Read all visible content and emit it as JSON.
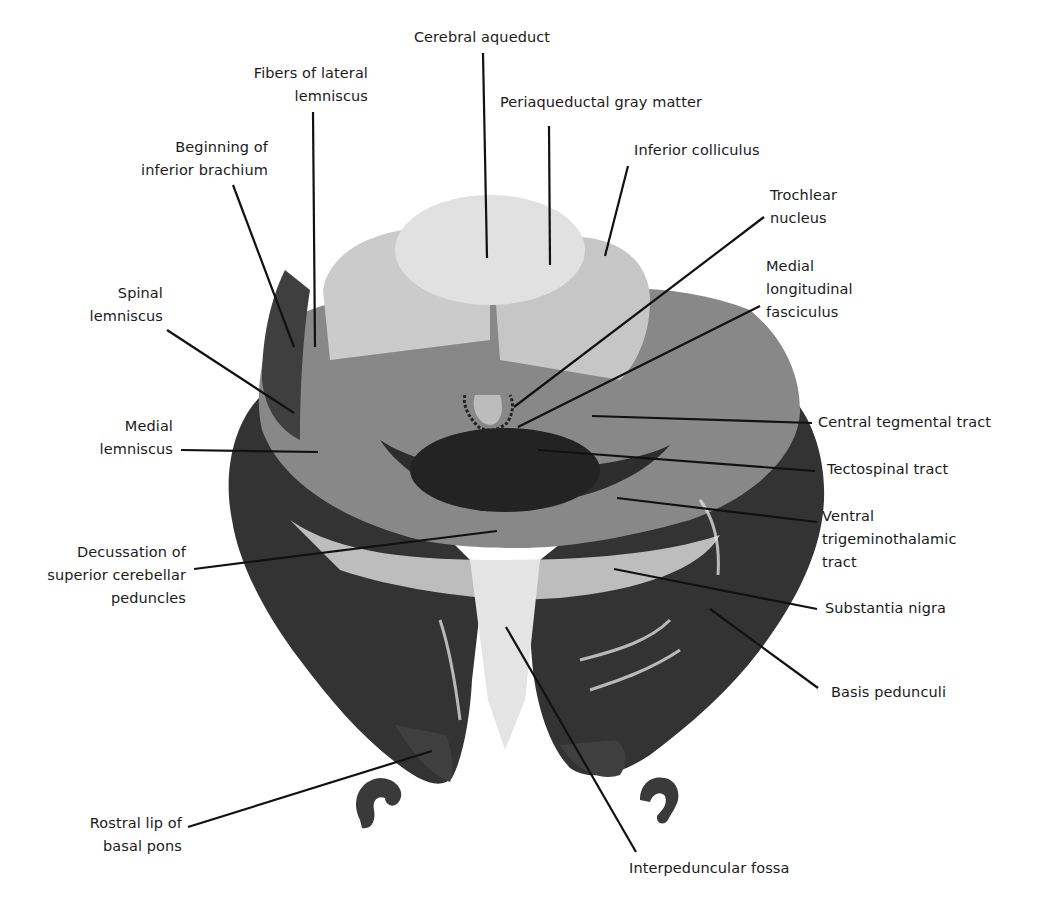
{
  "figure": {
    "colors": {
      "background": "#ffffff",
      "label_text": "#1a1a1a",
      "leader_line": "#111111",
      "tissue_light": "#cfcfcf",
      "tissue_mid": "#8a8a8a",
      "tissue_dark": "#2e2e2e"
    }
  },
  "labels": {
    "cerebral_aqueduct": "Cerebral aqueduct",
    "fibers_lateral_lemniscus": "Fibers of lateral\nlemniscus",
    "periaqueductal_gray": "Periaqueductal gray matter",
    "beginning_inferior_brachium": "Beginning of\ninferior brachium",
    "inferior_colliculus": "Inferior colliculus",
    "trochlear_nucleus": "Trochlear\nnucleus",
    "spinal_lemniscus": "Spinal\nlemniscus",
    "medial_longitudinal_fasciculus": "Medial\nlongitudinal\nfasciculus",
    "central_tegmental_tract": "Central tegmental tract",
    "medial_lemniscus": "Medial\nlemniscus",
    "tectospinal_tract": "Tectospinal tract",
    "ventral_trigeminothalamic_tract": "Ventral\ntrigeminothalamic\ntract",
    "decussation_scp": "Decussation of\nsuperior cerebellar\npeduncles",
    "substantia_nigra": "Substantia nigra",
    "basis_pedunculi": "Basis pedunculi",
    "rostral_lip_basal_pons": "Rostral lip of\nbasal pons",
    "interpeduncular_fossa": "Interpeduncular fossa"
  }
}
